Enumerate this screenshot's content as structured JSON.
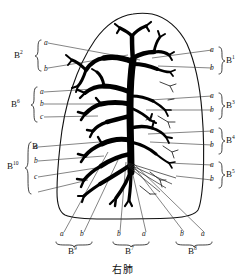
{
  "figure": {
    "caption": "右肺",
    "organ": "right lung bronchial tree",
    "outline_color": "#111111",
    "tree_color": "#000000",
    "leader_color": "#333333",
    "background": "#ffffff"
  },
  "left_labels": [
    {
      "segment": "B",
      "superscript": "2",
      "subsegments": [
        "a",
        "b"
      ],
      "brace": true
    },
    {
      "segment": "B",
      "superscript": "6",
      "subsegments": [
        "a",
        "b",
        "c"
      ],
      "brace": true
    },
    {
      "segment": "B",
      "superscript": "",
      "subsegments": [],
      "brace": false
    },
    {
      "segment": "B",
      "superscript": "10",
      "subsegments": [
        "a",
        "b",
        "c"
      ],
      "brace": true
    }
  ],
  "right_labels": [
    {
      "segment": "B",
      "superscript": "1",
      "subsegments": [
        "a",
        "b"
      ],
      "brace": true
    },
    {
      "segment": "B",
      "superscript": "3",
      "subsegments": [
        "a",
        "b"
      ],
      "brace": true
    },
    {
      "segment": "B",
      "superscript": "4",
      "subsegments": [
        "a",
        "b"
      ],
      "brace": true
    },
    {
      "segment": "B",
      "superscript": "5",
      "subsegments": [
        "a",
        "b"
      ],
      "brace": true
    }
  ],
  "bottom_labels": [
    {
      "segment": "B",
      "superscript": "9",
      "subsegments": [
        "a",
        "b"
      ],
      "brace": true
    },
    {
      "segment": "B",
      "superscript": "7",
      "subsegments": [
        "b",
        "a"
      ],
      "brace": true
    },
    {
      "segment": "B",
      "superscript": "8",
      "subsegments": [
        "b",
        "a"
      ],
      "brace": true
    }
  ],
  "text": {
    "B2": "B",
    "B2_sup": "2",
    "B6": "B",
    "B6_sup": "6",
    "B_plain": "B",
    "B10": "B",
    "B10_sup": "10",
    "B1": "B",
    "B1_sup": "1",
    "B3": "B",
    "B3_sup": "3",
    "B4": "B",
    "B4_sup": "4",
    "B5": "B",
    "B5_sup": "5",
    "B9": "B",
    "B9_sup": "9",
    "B7": "B",
    "B7_sup": "7",
    "B8": "B",
    "B8_sup": "8",
    "a": "a",
    "b": "b",
    "c": "c",
    "caption": "右肺"
  }
}
